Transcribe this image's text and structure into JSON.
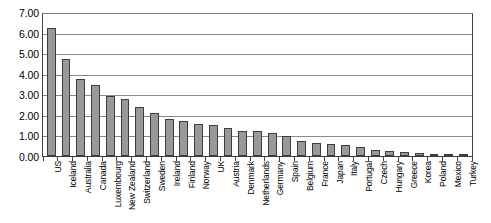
{
  "chart_data": {
    "type": "bar",
    "title": "",
    "subtitle": "",
    "xlabel": "",
    "ylabel": "",
    "ylim": [
      0,
      7
    ],
    "grid": true,
    "legend": false,
    "legend_position": "none",
    "y_ticks": [
      "0.00",
      "1.00",
      "2.00",
      "3.00",
      "4.00",
      "5.00",
      "6.00",
      "7.00"
    ],
    "y_tick_values": [
      0,
      1,
      2,
      3,
      4,
      5,
      6,
      7
    ],
    "bar_color": "#999999",
    "bar_edge_color": "#3d3d3d",
    "categories": [
      "US",
      "Iceland",
      "Australia",
      "Canada",
      "Luxembourg",
      "New Zealand",
      "Switzerland",
      "Sweden",
      "Ireland",
      "Finland",
      "Norway",
      "UK",
      "Austria",
      "Denmark",
      "Netherlands",
      "Germany",
      "Spain",
      "Belgium",
      "France",
      "Japan",
      "Italy",
      "Portugal",
      "Czech",
      "Hungary",
      "Greece",
      "Korea",
      "Poland",
      "Mexico",
      "Turkey"
    ],
    "values": [
      6.2,
      4.7,
      3.75,
      3.45,
      2.9,
      2.75,
      2.4,
      2.1,
      1.8,
      1.7,
      1.55,
      1.5,
      1.35,
      1.2,
      1.2,
      1.1,
      0.95,
      0.75,
      0.65,
      0.6,
      0.55,
      0.45,
      0.3,
      0.25,
      0.2,
      0.15,
      0.1,
      0.07,
      0.04
    ]
  }
}
